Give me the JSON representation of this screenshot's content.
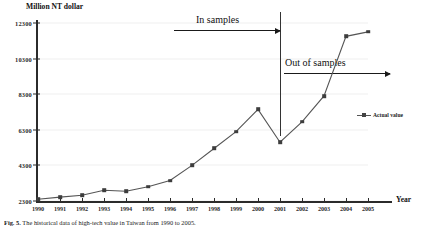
{
  "figure": {
    "caption_label": "Fig. 5.",
    "caption_text": "The historical data of high-tech value in Taiwan from 1990 to 2005."
  },
  "chart_data": {
    "type": "line",
    "title": "",
    "ylabel": "Million NT dollar",
    "xlabel": "Year",
    "ylim": [
      2300,
      12300
    ],
    "yticks": [
      2300,
      4300,
      6300,
      8300,
      10300,
      12300
    ],
    "grid": true,
    "legend_position": "right",
    "categories": [
      "1990",
      "1991",
      "1992",
      "1993",
      "1994",
      "1995",
      "1996",
      "1997",
      "1998",
      "1999",
      "2000",
      "2001",
      "2002",
      "2003",
      "2004",
      "2005"
    ],
    "series": [
      {
        "name": "Actual value",
        "color": "#3d3d3d",
        "marker": "square",
        "values": [
          2400,
          2520,
          2620,
          2900,
          2850,
          3100,
          3450,
          4300,
          5250,
          6200,
          7450,
          5600,
          6750,
          8200,
          11550,
          11800
        ]
      }
    ],
    "annotations": [
      {
        "id": "in-samples",
        "label": "In samples",
        "arrow": "right",
        "span_categories": [
          "1990",
          "2001"
        ]
      },
      {
        "id": "out-of-samples",
        "label": "Out of samples",
        "arrow": "right",
        "span_categories": [
          "2001",
          "2005"
        ]
      },
      {
        "id": "sample-divider",
        "label": "",
        "at_category": "2001"
      }
    ]
  },
  "legend": {
    "entries": [
      {
        "label": "Actual value",
        "marker_name": "line-square-marker"
      }
    ]
  }
}
